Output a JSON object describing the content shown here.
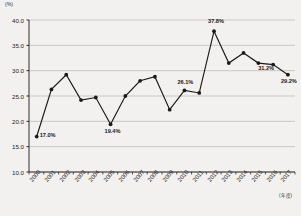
{
  "chart_data": {
    "type": "line",
    "title": "",
    "subtitle": "",
    "xlabel": "(年度)",
    "ylabel": "(%)",
    "ylim": [
      10.0,
      40.0
    ],
    "ytick_step": 5.0,
    "yticks": [
      "40.0",
      "35.0",
      "30.0",
      "25.0",
      "20.0",
      "15.0",
      "10.0"
    ],
    "grid": true,
    "legend": "none",
    "categories": [
      "2000",
      "2001",
      "2002",
      "2003",
      "2004",
      "2005",
      "2006",
      "2007",
      "2008",
      "2009",
      "2010",
      "2011",
      "2012",
      "2013",
      "2014",
      "2015",
      "2016",
      "2017"
    ],
    "values": [
      17.0,
      26.3,
      29.2,
      24.2,
      24.7,
      19.4,
      25.0,
      28.0,
      28.8,
      22.3,
      26.1,
      25.6,
      37.8,
      31.5,
      33.5,
      31.5,
      31.2,
      29.2
    ],
    "annotations": [
      {
        "category": "2000",
        "value": 17.0,
        "text": "17.0%"
      },
      {
        "category": "2005",
        "value": 19.4,
        "text": "19.4%"
      },
      {
        "category": "2010",
        "value": 26.1,
        "text": "26.1%"
      },
      {
        "category": "2012",
        "value": 37.8,
        "text": "37.8%"
      },
      {
        "category": "2016",
        "value": 31.2,
        "text": "31.2%"
      },
      {
        "category": "2017",
        "value": 29.2,
        "text": "29.2%"
      }
    ],
    "series_color": "#1a1a1a",
    "grid_color": "#b9b6b2",
    "background": "#f3f1ef"
  },
  "caption": {
    "text": ""
  }
}
